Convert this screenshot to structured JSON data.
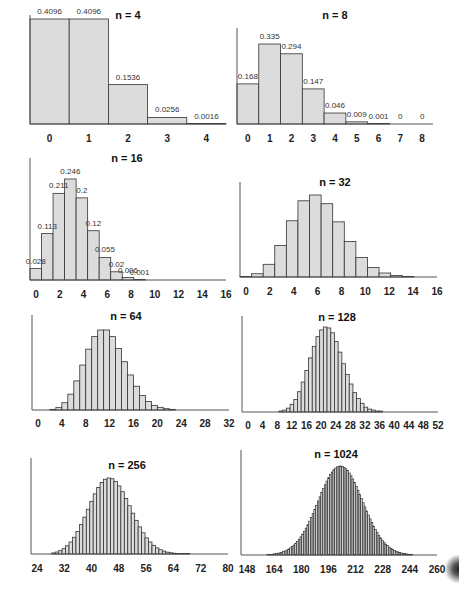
{
  "figure": {
    "bar_fill": "#dcdcdc",
    "bar_stroke": "#333333",
    "axis_color": "#555555"
  },
  "chart_data": [
    {
      "type": "bar",
      "title": "n = 4",
      "n": 4,
      "p": 0.2,
      "categories": [
        0,
        1,
        2,
        3,
        4
      ],
      "values": [
        0.4096,
        0.4096,
        0.1536,
        0.0256,
        0.0016
      ],
      "data_labels": [
        "0.4096",
        "0.4096",
        "0.1536",
        "0.0256",
        "0.0016"
      ],
      "xticks": [
        "0",
        "1",
        "2",
        "3",
        "4"
      ],
      "xlim": [
        0,
        4
      ],
      "grid": false
    },
    {
      "type": "bar",
      "title": "n = 8",
      "n": 8,
      "p": 0.2,
      "categories": [
        0,
        1,
        2,
        3,
        4,
        5,
        6,
        7,
        8
      ],
      "values": [
        0.168,
        0.335,
        0.294,
        0.147,
        0.046,
        0.009,
        0.001,
        0,
        0
      ],
      "data_labels": [
        "0.168",
        "0.335",
        "0.294",
        "0.147",
        "0.046",
        "0.009",
        "0.001",
        "0",
        "0"
      ],
      "xticks": [
        "0",
        "1",
        "2",
        "3",
        "4",
        "5",
        "6",
        "7",
        "8"
      ],
      "xlim": [
        0,
        8
      ],
      "grid": false
    },
    {
      "type": "bar",
      "title": "n = 16",
      "n": 16,
      "p": 0.2,
      "categories": [
        0,
        1,
        2,
        3,
        4,
        5,
        6,
        7,
        8,
        9,
        10,
        11,
        12,
        13,
        14,
        15,
        16
      ],
      "values": [
        0.028,
        0.113,
        0.211,
        0.246,
        0.2,
        0.12,
        0.055,
        0.02,
        0.006,
        0.001,
        0,
        0,
        0,
        0,
        0,
        0,
        0
      ],
      "data_labels": [
        "0.028",
        "0.113",
        "0.211",
        "0.246",
        "0.2",
        "0.12",
        "0.055",
        "0.02",
        "0.006",
        "0.001"
      ],
      "xticks": [
        "0",
        "2",
        "4",
        "6",
        "8",
        "10",
        "12",
        "14",
        "16"
      ],
      "xlim": [
        0,
        16
      ],
      "grid": false
    },
    {
      "type": "bar",
      "title": "n = 32",
      "n": 32,
      "p": 0.2,
      "categories": [
        0,
        1,
        2,
        3,
        4,
        5,
        6,
        7,
        8,
        9,
        10,
        11,
        12,
        13,
        14,
        15,
        16
      ],
      "values": [
        0.001,
        0.009,
        0.035,
        0.087,
        0.155,
        0.21,
        0.226,
        0.202,
        0.152,
        0.098,
        0.054,
        0.026,
        0.011,
        0.004,
        0.001,
        0.0,
        0.0
      ],
      "xticks": [
        "0",
        "2",
        "4",
        "6",
        "8",
        "10",
        "12",
        "14",
        "16"
      ],
      "xlim": [
        0,
        16
      ],
      "grid": false
    },
    {
      "type": "bar",
      "title": "n = 64",
      "n": 64,
      "p": 0.2,
      "x_start": 0,
      "values": [
        0.0,
        0.0,
        0.0,
        0.001,
        0.004,
        0.011,
        0.024,
        0.044,
        0.068,
        0.092,
        0.111,
        0.121,
        0.121,
        0.111,
        0.093,
        0.073,
        0.053,
        0.036,
        0.022,
        0.013,
        0.007,
        0.004,
        0.002,
        0.001,
        0.0
      ],
      "xticks": [
        "0",
        "4",
        "8",
        "12",
        "16",
        "20",
        "24",
        "28",
        "32"
      ],
      "xlim": [
        0,
        32
      ],
      "grid": false
    },
    {
      "type": "bar",
      "title": "n = 128",
      "n": 128,
      "p": 0.2,
      "x_start": 10,
      "values": [
        0.001,
        0.002,
        0.004,
        0.008,
        0.013,
        0.021,
        0.031,
        0.043,
        0.056,
        0.068,
        0.078,
        0.085,
        0.088,
        0.087,
        0.082,
        0.073,
        0.062,
        0.05,
        0.039,
        0.029,
        0.02,
        0.014,
        0.009,
        0.005,
        0.003,
        0.002,
        0.001,
        0.001,
        0.0,
        0.0,
        0.0
      ],
      "xticks": [
        "0",
        "4",
        "8",
        "12",
        "16",
        "20",
        "24",
        "28",
        "32",
        "36",
        "40",
        "44",
        "48",
        "52"
      ],
      "xlim": [
        0,
        52
      ],
      "grid": false
    },
    {
      "type": "bar",
      "title": "n = 256",
      "n": 256,
      "p": 0.2,
      "x_start": 30,
      "values": [
        0.0007,
        0.0013,
        0.0022,
        0.0035,
        0.0054,
        0.0079,
        0.011,
        0.0148,
        0.0193,
        0.0242,
        0.0294,
        0.0346,
        0.0395,
        0.0437,
        0.047,
        0.0491,
        0.0499,
        0.0494,
        0.0476,
        0.0447,
        0.0409,
        0.0365,
        0.0317,
        0.0268,
        0.0221,
        0.0178,
        0.0139,
        0.0106,
        0.0079,
        0.0057,
        0.004,
        0.0028,
        0.0019,
        0.0012,
        0.0008,
        0.0005,
        0.0003,
        0.0002,
        0.0001,
        0.0001,
        0.0,
        0.0,
        0.0
      ],
      "xticks": [
        "24",
        "32",
        "40",
        "48",
        "56",
        "64",
        "72",
        "80"
      ],
      "xlim": [
        24,
        80
      ],
      "grid": false
    },
    {
      "type": "bar",
      "title": "n = 1024",
      "n": 1024,
      "p": 0.2,
      "mean": 204.8,
      "sd": 12.8,
      "distribution": "normal-approximation",
      "xticks": [
        "148",
        "164",
        "180",
        "196",
        "212",
        "228",
        "244",
        "260"
      ],
      "xlim": [
        148,
        260
      ],
      "grid": false
    }
  ]
}
